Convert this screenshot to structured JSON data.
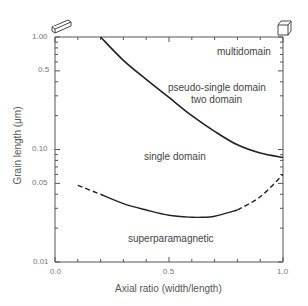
{
  "chart_data": {
    "type": "line",
    "title": "",
    "xlabel": "Axial ratio (width/length)",
    "ylabel": "Grain length (μm)",
    "xlim": [
      0.0,
      1.0
    ],
    "ylim": [
      0.01,
      1.0
    ],
    "yscale": "log",
    "x_ticks": [
      "0.0",
      "0.5",
      "1.0"
    ],
    "y_ticks": [
      "1.00",
      "0.5",
      "0.10",
      "0.05",
      "0.01"
    ],
    "grid": false,
    "series": [
      {
        "name": "single domain / multidomain boundary",
        "style": "solid",
        "x": [
          0.2,
          0.3,
          0.4,
          0.5,
          0.6,
          0.7,
          0.8,
          0.9,
          1.0
        ],
        "y": [
          1.0,
          0.62,
          0.42,
          0.29,
          0.2,
          0.145,
          0.11,
          0.093,
          0.085
        ]
      },
      {
        "name": "superparamagnetic / single domain boundary",
        "style": "solid with dashed ends",
        "x": [
          0.1,
          0.2,
          0.3,
          0.4,
          0.5,
          0.6,
          0.65,
          0.7,
          0.8,
          0.9,
          1.0
        ],
        "y": [
          0.048,
          0.04,
          0.033,
          0.029,
          0.026,
          0.025,
          0.025,
          0.0255,
          0.029,
          0.038,
          0.06
        ]
      }
    ],
    "annotations": [
      "multidomain",
      "pseudo-single domain",
      "two domain",
      "single domain",
      "superparamagnetic"
    ],
    "corner_icons": [
      "elongated-prism (axial ratio 0)",
      "cube (axial ratio 1)"
    ]
  },
  "labels": {
    "multidomain": "multidomain",
    "psd": "pseudo-single domain",
    "two_domain": "two domain",
    "single_domain": "single domain",
    "spm": "superparamagnetic",
    "xlabel": "Axial ratio (width/length)",
    "ylabel": "Grain length (μm)",
    "y1": "1.00",
    "y05": "0.5",
    "y01": "0.10",
    "y005": "0.05",
    "y001": "0.01",
    "x0": "0.0",
    "x05": "0.5",
    "x1": "1.0"
  }
}
